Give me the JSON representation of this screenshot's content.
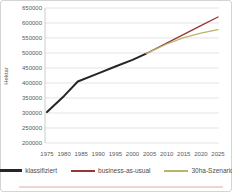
{
  "chart_data": {
    "type": "line",
    "title": "",
    "xlabel": "",
    "ylabel": "Hektar",
    "xlim": [
      1975,
      2025
    ],
    "ylim": [
      200000,
      650000
    ],
    "x_ticks": [
      1975,
      1980,
      1985,
      1990,
      1995,
      2000,
      2005,
      2010,
      2015,
      2020,
      2025
    ],
    "y_ticks": [
      200000,
      250000,
      300000,
      350000,
      400000,
      450000,
      500000,
      550000,
      600000,
      650000
    ],
    "grid": "horizontal",
    "legend_position": "bottom",
    "series": [
      {
        "name": "klassifiziert",
        "color": "#262626",
        "stroke_width": 2,
        "points": [
          [
            1975,
            303000
          ],
          [
            1980,
            357000
          ],
          [
            1984,
            405000
          ],
          [
            1990,
            432000
          ],
          [
            1995,
            455000
          ],
          [
            2000,
            477000
          ],
          [
            2004,
            498000
          ]
        ]
      },
      {
        "name": "business-as-usual",
        "color": "#953735",
        "stroke_width": 1.3,
        "points": [
          [
            2004,
            498000
          ],
          [
            2010,
            533000
          ],
          [
            2015,
            562000
          ],
          [
            2020,
            591000
          ],
          [
            2025,
            620000
          ]
        ]
      },
      {
        "name": "30ha-Szenario",
        "color": "#b9b36f",
        "stroke_width": 1.3,
        "points": [
          [
            2004,
            498000
          ],
          [
            2010,
            530000
          ],
          [
            2015,
            551000
          ],
          [
            2020,
            566000
          ],
          [
            2025,
            578000
          ]
        ]
      }
    ]
  },
  "legend": {
    "items": [
      {
        "label": "klassifiziert"
      },
      {
        "label": "business-as-usual"
      },
      {
        "label": "30ha-Szenario"
      }
    ]
  },
  "colors": {
    "grid": "#d9d9d9",
    "axis": "#bfbfbf",
    "tick_text": "#595959",
    "frame_border": "#d4d4d4",
    "bottom_accent": "#e6c3bf"
  }
}
